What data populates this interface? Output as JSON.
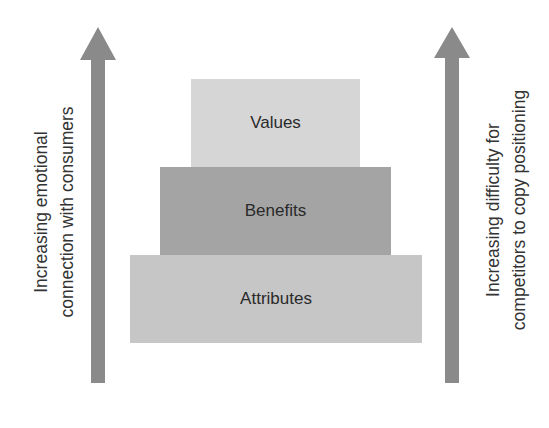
{
  "diagram": {
    "levels": [
      {
        "label": "Values",
        "color": "#d6d6d6"
      },
      {
        "label": "Benefits",
        "color": "#a4a4a4"
      },
      {
        "label": "Attributes",
        "color": "#c6c6c6"
      }
    ],
    "left_axis": {
      "lines": [
        "Increasing emotional",
        "connection with consumers"
      ],
      "arrow_color": "#8a8a8a"
    },
    "right_axis": {
      "lines": [
        "Increasing difficulty for",
        "competitors to copy positioning"
      ],
      "arrow_color": "#8a8a8a"
    }
  }
}
